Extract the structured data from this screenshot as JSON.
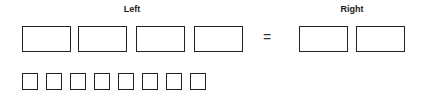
{
  "labels": {
    "left": "Left",
    "right": "Right"
  },
  "equals": "=",
  "left_boxes": [
    22,
    78,
    136,
    194
  ],
  "right_boxes": [
    299,
    356
  ],
  "unit_squares": [
    22,
    46,
    70,
    94,
    118,
    142,
    166,
    190
  ],
  "colors": {
    "stroke": "#222222",
    "background": "#ffffff"
  }
}
